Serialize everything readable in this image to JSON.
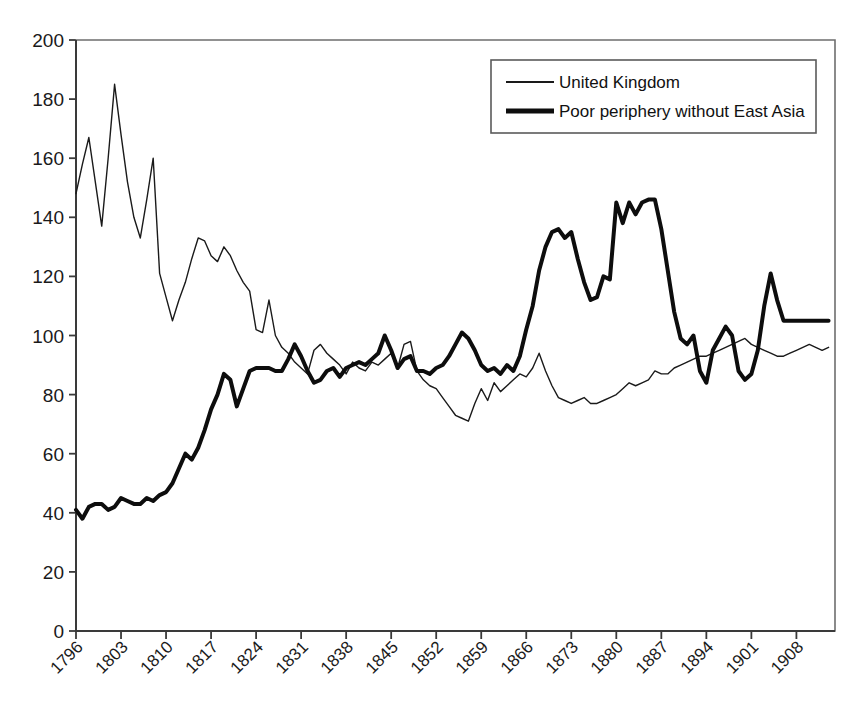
{
  "chart_data": {
    "type": "line",
    "title": "",
    "subtitle": "",
    "xlabel": "",
    "ylabel": "",
    "xlim": [
      1796,
      1914
    ],
    "ylim": [
      0,
      200
    ],
    "grid": false,
    "legend_position": "top-right",
    "y_ticks": [
      0,
      20,
      40,
      60,
      80,
      100,
      120,
      140,
      160,
      180,
      200
    ],
    "x_ticks": [
      1796,
      1803,
      1810,
      1817,
      1824,
      1831,
      1838,
      1845,
      1852,
      1859,
      1866,
      1873,
      1880,
      1887,
      1894,
      1901,
      1908
    ],
    "x_tick_labels": [
      "1796",
      "1803",
      "1810",
      "1817",
      "1824",
      "1831",
      "1838",
      "1845",
      "1852",
      "1859",
      "1866",
      "1873",
      "1880",
      "1887",
      "1894",
      "1901",
      "1908"
    ],
    "series": [
      {
        "name": "United Kingdom",
        "color": "#1a1a1a",
        "line_width": 1.4,
        "x": [
          1796,
          1797,
          1798,
          1799,
          1800,
          1801,
          1802,
          1803,
          1804,
          1805,
          1806,
          1807,
          1808,
          1809,
          1810,
          1811,
          1812,
          1813,
          1814,
          1815,
          1816,
          1817,
          1818,
          1819,
          1820,
          1821,
          1822,
          1823,
          1824,
          1825,
          1826,
          1827,
          1828,
          1829,
          1830,
          1831,
          1832,
          1833,
          1834,
          1835,
          1836,
          1837,
          1838,
          1839,
          1840,
          1841,
          1842,
          1843,
          1844,
          1845,
          1846,
          1847,
          1848,
          1849,
          1850,
          1851,
          1852,
          1853,
          1854,
          1855,
          1856,
          1857,
          1858,
          1859,
          1860,
          1861,
          1862,
          1863,
          1864,
          1865,
          1866,
          1867,
          1868,
          1869,
          1870,
          1871,
          1872,
          1873,
          1874,
          1875,
          1876,
          1877,
          1878,
          1879,
          1880,
          1881,
          1882,
          1883,
          1884,
          1885,
          1886,
          1887,
          1888,
          1889,
          1890,
          1891,
          1892,
          1893,
          1894,
          1895,
          1896,
          1897,
          1898,
          1899,
          1900,
          1901,
          1902,
          1903,
          1904,
          1905,
          1906,
          1907,
          1908,
          1909,
          1910,
          1911,
          1912,
          1913
        ],
        "values": [
          148,
          158,
          167,
          152,
          137,
          160,
          185,
          168,
          152,
          140,
          133,
          146,
          160,
          121,
          113,
          105,
          112,
          118,
          126,
          133,
          132,
          127,
          125,
          130,
          127,
          122,
          118,
          115,
          102,
          101,
          112,
          100,
          96,
          94,
          91,
          89,
          87,
          95,
          97,
          94,
          92,
          90,
          87,
          91,
          89,
          88,
          91,
          90,
          92,
          94,
          89,
          97,
          98,
          88,
          85,
          83,
          82,
          79,
          76,
          73,
          72,
          71,
          77,
          82,
          78,
          84,
          81,
          83,
          85,
          87,
          86,
          89,
          94,
          88,
          83,
          79,
          78,
          77,
          78,
          79,
          77,
          77,
          78,
          79,
          80,
          82,
          84,
          83,
          84,
          85,
          88,
          87,
          87,
          89,
          90,
          91,
          92,
          93,
          93,
          94,
          95,
          96,
          97,
          98,
          99,
          97,
          96,
          95,
          94,
          93,
          93,
          94,
          95,
          96,
          97,
          96,
          95,
          96
        ]
      },
      {
        "name": "Poor periphery without East Asia",
        "color": "#0d0d0d",
        "line_width": 4.0,
        "x": [
          1796,
          1797,
          1798,
          1799,
          1800,
          1801,
          1802,
          1803,
          1804,
          1805,
          1806,
          1807,
          1808,
          1809,
          1810,
          1811,
          1812,
          1813,
          1814,
          1815,
          1816,
          1817,
          1818,
          1819,
          1820,
          1821,
          1822,
          1823,
          1824,
          1825,
          1826,
          1827,
          1828,
          1829,
          1830,
          1831,
          1832,
          1833,
          1834,
          1835,
          1836,
          1837,
          1838,
          1839,
          1840,
          1841,
          1842,
          1843,
          1844,
          1845,
          1846,
          1847,
          1848,
          1849,
          1850,
          1851,
          1852,
          1853,
          1854,
          1855,
          1856,
          1857,
          1858,
          1859,
          1860,
          1861,
          1862,
          1863,
          1864,
          1865,
          1866,
          1867,
          1868,
          1869,
          1870,
          1871,
          1872,
          1873,
          1874,
          1875,
          1876,
          1877,
          1878,
          1879,
          1880,
          1881,
          1882,
          1883,
          1884,
          1885,
          1886,
          1887,
          1888,
          1889,
          1890,
          1891,
          1892,
          1893,
          1894,
          1895,
          1896,
          1897,
          1898,
          1899,
          1900,
          1901,
          1902,
          1903,
          1904,
          1905,
          1906,
          1907,
          1908,
          1909,
          1910,
          1911,
          1912,
          1913
        ],
        "values": [
          41,
          38,
          42,
          43,
          43,
          41,
          42,
          45,
          44,
          43,
          43,
          45,
          44,
          46,
          47,
          50,
          55,
          60,
          58,
          62,
          68,
          75,
          80,
          87,
          85,
          76,
          82,
          88,
          89,
          89,
          89,
          88,
          88,
          92,
          97,
          93,
          88,
          84,
          85,
          88,
          89,
          86,
          89,
          90,
          91,
          90,
          92,
          94,
          100,
          95,
          89,
          92,
          93,
          88,
          88,
          87,
          89,
          90,
          93,
          97,
          101,
          99,
          95,
          90,
          88,
          89,
          87,
          90,
          88,
          93,
          102,
          110,
          122,
          130,
          135,
          136,
          133,
          135,
          126,
          118,
          112,
          113,
          120,
          119,
          145,
          138,
          145,
          141,
          145,
          146,
          146,
          136,
          122,
          108,
          99,
          97,
          100,
          88,
          84,
          95,
          99,
          103,
          100,
          88,
          85,
          87,
          95,
          110,
          121,
          112,
          105,
          105,
          105,
          105,
          105,
          105,
          105,
          105
        ]
      }
    ]
  },
  "legend": {
    "entries": [
      {
        "label": "United Kingdom",
        "style": "thin-line"
      },
      {
        "label": "Poor periphery without East Asia",
        "style": "thick-line"
      }
    ]
  },
  "axes": {
    "y_axis_name": "y-axis",
    "x_axis_name": "x-axis"
  }
}
